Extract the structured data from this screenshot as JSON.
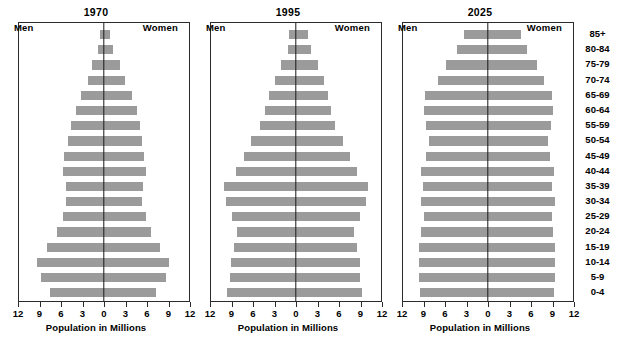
{
  "figure": {
    "axis_title": "Population in Millions",
    "men_label": "Men",
    "women_label": "Women",
    "bar_color": "#9b9b9b",
    "frame_color": "#2b2b2b",
    "center_line_color": "#1a1a1a"
  },
  "chart_data": {
    "type": "bar",
    "subtype": "population-pyramid",
    "title": "",
    "xlabel": "Population in Millions",
    "ylabel": "",
    "xlim": [
      -12,
      12
    ],
    "xticks": [
      12,
      9,
      6,
      3,
      0,
      3,
      6,
      9,
      12
    ],
    "xtick_labels": [
      "12",
      "9",
      "6",
      "3",
      "0",
      "3",
      "6",
      "9",
      "12"
    ],
    "grid": false,
    "legend_position": "in-plot",
    "legend": [
      "Men",
      "Women"
    ],
    "categories": [
      "85+",
      "80-84",
      "75-79",
      "70-74",
      "65-69",
      "60-64",
      "55-59",
      "50-54",
      "45-49",
      "40-44",
      "35-39",
      "30-34",
      "25-29",
      "20-24",
      "15-19",
      "10-14",
      "5-9",
      "0-4"
    ],
    "panels": [
      {
        "title": "1970",
        "men_label": "Men",
        "women_label": "Women",
        "xlabel": "Population in Millions",
        "series": [
          {
            "name": "Men",
            "values": [
              0.6,
              0.9,
              1.7,
              2.3,
              3.2,
              4.0,
              4.7,
              5.1,
              5.6,
              5.8,
              5.4,
              5.3,
              5.8,
              6.6,
              8.0,
              9.4,
              8.9,
              7.6
            ]
          },
          {
            "name": "Women",
            "values": [
              0.9,
              1.3,
              2.3,
              3.0,
              3.9,
              4.6,
              5.1,
              5.4,
              5.7,
              5.9,
              5.5,
              5.4,
              5.9,
              6.7,
              7.9,
              9.2,
              8.7,
              7.4
            ]
          }
        ]
      },
      {
        "title": "1995",
        "men_label": "Men",
        "women_label": "Women",
        "xlabel": "Population in Millions",
        "series": [
          {
            "name": "Men",
            "values": [
              1.0,
              1.2,
              2.1,
              2.9,
              3.8,
              4.4,
              5.1,
              6.3,
              7.4,
              8.5,
              10.1,
              9.9,
              9.0,
              8.4,
              8.8,
              9.2,
              9.3,
              9.7
            ]
          },
          {
            "name": "Women",
            "values": [
              1.7,
              2.1,
              3.1,
              3.9,
              4.5,
              4.9,
              5.5,
              6.6,
              7.6,
              8.6,
              10.2,
              9.9,
              9.0,
              8.2,
              8.6,
              9.0,
              9.1,
              9.3
            ]
          }
        ]
      },
      {
        "title": "2025",
        "men_label": "Men",
        "women_label": "Women",
        "xlabel": "Population in Millions",
        "series": [
          {
            "name": "Men",
            "values": [
              3.4,
              4.4,
              6.0,
              7.1,
              8.9,
              9.0,
              8.7,
              8.3,
              8.7,
              9.4,
              9.2,
              9.5,
              9.1,
              9.4,
              9.7,
              9.7,
              9.7,
              9.6
            ]
          },
          {
            "name": "Women",
            "values": [
              4.7,
              5.5,
              6.9,
              7.9,
              9.1,
              9.2,
              8.9,
              8.5,
              8.7,
              9.3,
              9.1,
              9.4,
              9.0,
              9.2,
              9.4,
              9.4,
              9.4,
              9.3
            ]
          }
        ]
      }
    ]
  }
}
